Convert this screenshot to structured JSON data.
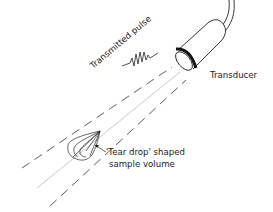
{
  "diagram": {
    "labels": {
      "pulse": "Transmitted pulse",
      "transducer": "Transducer",
      "sample_line1": "'Tear drop' shaped",
      "sample_line2": "sample volume"
    },
    "colors": {
      "ink": "#222222",
      "beam_center": "#bbbbbb",
      "background": "#ffffff"
    }
  }
}
